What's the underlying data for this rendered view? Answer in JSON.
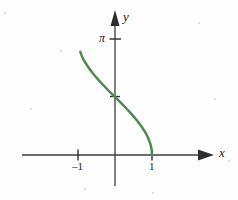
{
  "figure": {
    "background_color": "#fefefe",
    "axis_color": "#3c3c3c",
    "curve_color": "#4e8b4e"
  },
  "labels": {
    "x_axis": "x",
    "y_axis": "y",
    "pi_tick": "π",
    "tick_neg_one": "–1",
    "tick_one": "1"
  },
  "chart_data": {
    "type": "line",
    "title": "",
    "subtitle": "",
    "xlabel": "x",
    "ylabel": "y",
    "xlim": [
      -1.55,
      1.3
    ],
    "ylim": [
      -0.35,
      3.6
    ],
    "grid": false,
    "legend": null,
    "xticks": [
      -1,
      1
    ],
    "xticklabels": [
      "–1",
      "1"
    ],
    "yticks": [
      1.5707963,
      3.1415927
    ],
    "yticklabels": [
      "",
      "π"
    ],
    "annotations": [
      {
        "text": "π",
        "x": -0.22,
        "y": 3.1416
      },
      {
        "text": "–1",
        "x": -1,
        "y": -0.25
      },
      {
        "text": "1",
        "x": 1,
        "y": -0.25
      },
      {
        "text": "x",
        "x": 1.24,
        "y": 0.17
      },
      {
        "text": "y",
        "x": 0.11,
        "y": 3.52
      }
    ],
    "series": [
      {
        "name": "y = arccos(x)",
        "function": "arccos",
        "x": [
          -0.94,
          -0.9,
          -0.85,
          -0.8,
          -0.7,
          -0.6,
          -0.5,
          -0.4,
          -0.3,
          -0.2,
          -0.1,
          0.0,
          0.1,
          0.2,
          0.3,
          0.4,
          0.5,
          0.6,
          0.7,
          0.8,
          0.85,
          0.9,
          0.94,
          0.97,
          0.99,
          1.0
        ],
        "y": [
          2.795,
          2.69,
          2.586,
          2.498,
          2.346,
          2.214,
          2.094,
          1.982,
          1.875,
          1.772,
          1.671,
          1.571,
          1.471,
          1.369,
          1.266,
          1.159,
          1.047,
          0.927,
          0.795,
          0.644,
          0.555,
          0.451,
          0.348,
          0.245,
          0.142,
          0.0
        ]
      }
    ]
  },
  "decorations": {
    "specks": [
      {
        "x": 4,
        "y": 12,
        "r": 1
      },
      {
        "x": 198,
        "y": 22,
        "r": 1
      },
      {
        "x": 30,
        "y": 108,
        "r": 1
      },
      {
        "x": 214,
        "y": 98,
        "r": 1
      },
      {
        "x": 84,
        "y": 188,
        "r": 1
      },
      {
        "x": 152,
        "y": 192,
        "r": 1
      },
      {
        "x": 60,
        "y": 50,
        "r": 1
      },
      {
        "x": 228,
        "y": 160,
        "r": 1
      }
    ]
  }
}
